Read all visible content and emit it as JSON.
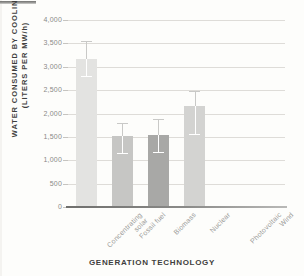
{
  "chart_data": {
    "type": "bar",
    "title": "",
    "xlabel": "GENERATION TECHNOLOGY",
    "ylabel": "WATER CONSUMED BY COOLING (LITERS PER MW/h)",
    "ylabel_line1": "WATER CONSUMED BY COOLING",
    "ylabel_line2": "(LITERS PER MW/h)",
    "categories": [
      "Concentrating\nsolar",
      "Fossil fuel",
      "Biomass",
      "Nuclear",
      "Photovoltaic",
      "Wind"
    ],
    "values": [
      3170,
      1510,
      1530,
      2170,
      0,
      0
    ],
    "error_low": [
      2810,
      1150,
      1180,
      1570,
      0,
      0
    ],
    "error_high": [
      3550,
      1790,
      1880,
      2480,
      0,
      0
    ],
    "bar_colors": [
      "#e3e3e1",
      "#c6c6c4",
      "#a8a8a6",
      "#d3d3d1",
      "#fdfdfb",
      "#fdfdfb"
    ],
    "ylim": [
      0,
      4000
    ],
    "yticks": [
      0,
      500,
      1000,
      1500,
      2000,
      2500,
      3000,
      3500,
      4000
    ],
    "ytick_labels": [
      "0",
      "500",
      "1,000",
      "1,500",
      "2,000",
      "2,500",
      "3,000",
      "3,500",
      "4,000"
    ],
    "grid": true,
    "legend": "none"
  }
}
